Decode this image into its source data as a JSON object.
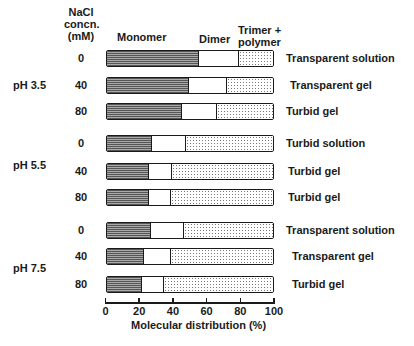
{
  "chart_data": {
    "type": "bar",
    "orientation": "horizontal-stacked-100",
    "title": "",
    "xlabel": "Molecular distribution (%)",
    "ylabel": "NaCl concn. (mM)",
    "xlim": [
      0,
      100
    ],
    "xticks": [
      0,
      20,
      40,
      60,
      80,
      100
    ],
    "grid": false,
    "series_headers": [
      "Monomer",
      "Dimer",
      "Trimer + polymer"
    ],
    "groups": [
      {
        "label": "pH 3.5",
        "rows": [
          {
            "nacl": "0",
            "monomer": 55,
            "dimer": 24,
            "trimer_polymer": 21,
            "state": "Transparent solution"
          },
          {
            "nacl": "40",
            "monomer": 49,
            "dimer": 23,
            "trimer_polymer": 28,
            "state": "Transparent gel"
          },
          {
            "nacl": "80",
            "monomer": 45,
            "dimer": 21,
            "trimer_polymer": 34,
            "state": "Turbid gel"
          }
        ]
      },
      {
        "label": "pH 5.5",
        "rows": [
          {
            "nacl": "0",
            "monomer": 27,
            "dimer": 20,
            "trimer_polymer": 53,
            "state": "Turbid solution"
          },
          {
            "nacl": "40",
            "monomer": 25,
            "dimer": 14,
            "trimer_polymer": 61,
            "state": "Turbid gel"
          },
          {
            "nacl": "80",
            "monomer": 25,
            "dimer": 13,
            "trimer_polymer": 62,
            "state": "Turbid gel"
          }
        ]
      },
      {
        "label": "pH 7.5",
        "rows": [
          {
            "nacl": "0",
            "monomer": 26,
            "dimer": 20,
            "trimer_polymer": 54,
            "state": "Transparent solution"
          },
          {
            "nacl": "40",
            "monomer": 22,
            "dimer": 16,
            "trimer_polymer": 62,
            "state": "Transparent gel"
          },
          {
            "nacl": "80",
            "monomer": 21,
            "dimer": 13,
            "trimer_polymer": 66,
            "state": "Turbid gel"
          }
        ]
      }
    ]
  },
  "header": {
    "nacl_line1": "NaCl",
    "nacl_line2": "concn.",
    "nacl_line3": "(mM)",
    "monomer": "Monomer",
    "dimer": "Dimer",
    "trimer_line1": "Trimer +",
    "trimer_line2": "polymer"
  },
  "axis": {
    "ticks": [
      "0",
      "20",
      "40",
      "60",
      "80",
      "100"
    ],
    "title": "Molecular distribution (%)"
  }
}
